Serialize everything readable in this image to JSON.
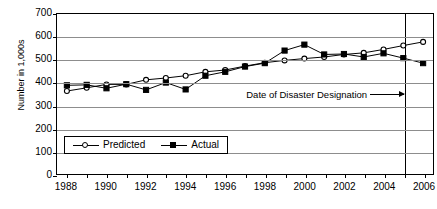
{
  "chart_data": {
    "type": "line",
    "title": "",
    "xlabel": "",
    "ylabel": "Number in 1,000s",
    "x": [
      1988,
      1989,
      1990,
      1991,
      1992,
      1993,
      1994,
      1995,
      1996,
      1997,
      1998,
      1999,
      2000,
      2001,
      2002,
      2003,
      2004,
      2005,
      2006
    ],
    "xlim": [
      1987.5,
      2006.5
    ],
    "ylim": [
      0,
      700
    ],
    "yticks": [
      0,
      100,
      200,
      300,
      400,
      500,
      600,
      700
    ],
    "xticks": [
      1988,
      1990,
      1992,
      1994,
      1996,
      1998,
      2000,
      2002,
      2004,
      2006
    ],
    "grid": "horizontal",
    "legend_position": "lower-left-inside",
    "series": [
      {
        "name": "Predicted",
        "marker": "open-circle",
        "values": [
          363,
          377,
          392,
          392,
          412,
          420,
          430,
          447,
          455,
          472,
          487,
          497,
          505,
          512,
          523,
          530,
          545,
          562,
          578
        ]
      },
      {
        "name": "Actual",
        "marker": "filled-square",
        "values": [
          388,
          390,
          375,
          393,
          368,
          400,
          370,
          430,
          447,
          470,
          485,
          540,
          566,
          523,
          525,
          512,
          528,
          507,
          485
        ]
      }
    ],
    "annotations": [
      {
        "name": "date-of-disaster-designation",
        "text": "Date of Disaster Designation",
        "x": 2005,
        "type": "vertical-line-with-arrow-label"
      }
    ]
  },
  "axis": {
    "ytick_labels": [
      "700",
      "600",
      "500",
      "400",
      "300",
      "200",
      "100",
      "0"
    ],
    "xtick_labels": [
      "1988",
      "1990",
      "1992",
      "1994",
      "1996",
      "1998",
      "2000",
      "2002",
      "2004",
      "2006"
    ],
    "ylabel": "Number in 1,000s"
  },
  "legend": {
    "items": [
      {
        "label": "Predicted",
        "marker": "open-circle"
      },
      {
        "label": "Actual",
        "marker": "filled-square"
      }
    ]
  },
  "annotation": {
    "text": "Date of Disaster Designation"
  },
  "colors": {
    "line": "#000000",
    "grid": "#8d8d8d",
    "background": "#ffffff"
  }
}
